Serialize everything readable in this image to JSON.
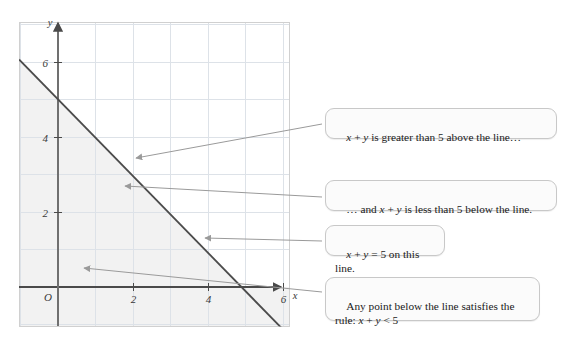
{
  "figure": {
    "colors": {
      "background": "#ffffff",
      "plot_fill": "#ffffff",
      "shaded_region": "#f2f2f2",
      "grid": "#d8dde3",
      "plot_border": "#cccccc",
      "axis": "#4a4a4a",
      "line": "#4b4b4b",
      "arrow": "#9a9a9a",
      "callout_bg": "#fbfbfb",
      "callout_border": "#c8c8c8",
      "text": "#1a1a1a"
    }
  },
  "chart_data": {
    "type": "line",
    "title": "",
    "xlabel": "x",
    "ylabel": "y",
    "xlim": [
      -1,
      7.2
    ],
    "ylim": [
      -1.05,
      7.1
    ],
    "grid": true,
    "x_ticks": [
      2,
      4,
      6
    ],
    "x_tick_labels": [
      "2",
      "4",
      "6"
    ],
    "y_ticks": [
      2,
      4,
      6
    ],
    "y_tick_labels": [
      "2",
      "4",
      "6"
    ],
    "origin_label": "O",
    "grid_step": 1,
    "series": [
      {
        "name": "x + y = 5",
        "equation": "x + y = 5",
        "slope": -1,
        "intercept": 5,
        "points": [
          [
            -1,
            6
          ],
          [
            0,
            5
          ],
          [
            2,
            3
          ],
          [
            4,
            1
          ],
          [
            5,
            0
          ],
          [
            6,
            -1
          ]
        ]
      }
    ],
    "shaded_region": {
      "name": "x + y < 5",
      "inequality": "x + y < 5",
      "description": "region below and left of the line"
    }
  },
  "annotations": [
    {
      "id": "above",
      "text": "x + y is greater than 5 above the line…",
      "arrow_from": [
        318,
        124
      ],
      "arrow_to": [
        133,
        158
      ]
    },
    {
      "id": "below",
      "text": "… and x + y is less than 5 below the line.",
      "arrow_from": [
        318,
        196
      ],
      "arrow_to": [
        122,
        186
      ]
    },
    {
      "id": "online",
      "text": "x + y = 5 on this line.",
      "arrow_from": [
        318,
        240
      ],
      "arrow_to": [
        202,
        238
      ]
    },
    {
      "id": "rule",
      "text": "Any point below the line satisfies the rule: x + y < 5",
      "arrow_from": [
        318,
        292
      ],
      "arrow_to": [
        80,
        268
      ]
    }
  ],
  "axis_labels": {
    "x_axis_name": "x",
    "y_axis_name": "y",
    "origin": "O"
  }
}
